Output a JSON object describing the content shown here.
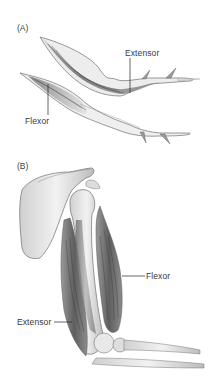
{
  "figure": {
    "panels": [
      {
        "id": "A",
        "letter": "(A)",
        "subject": "arthropod leg segments",
        "labels": {
          "extensor": "Extensor",
          "flexor": "Flexor"
        }
      },
      {
        "id": "B",
        "letter": "(B)",
        "subject": "human upper arm and shoulder",
        "labels": {
          "flexor": "Flexor",
          "extensor": "Extensor"
        }
      }
    ]
  },
  "colors": {
    "background": "#ffffff",
    "label_text": "#3a3a3a",
    "leader_line": "#222222",
    "muscle_dark": "#5a5a5a",
    "muscle_mid": "#8a8a8a",
    "bone_light": "#e6e6e6",
    "outline": "#6e6e6e"
  }
}
